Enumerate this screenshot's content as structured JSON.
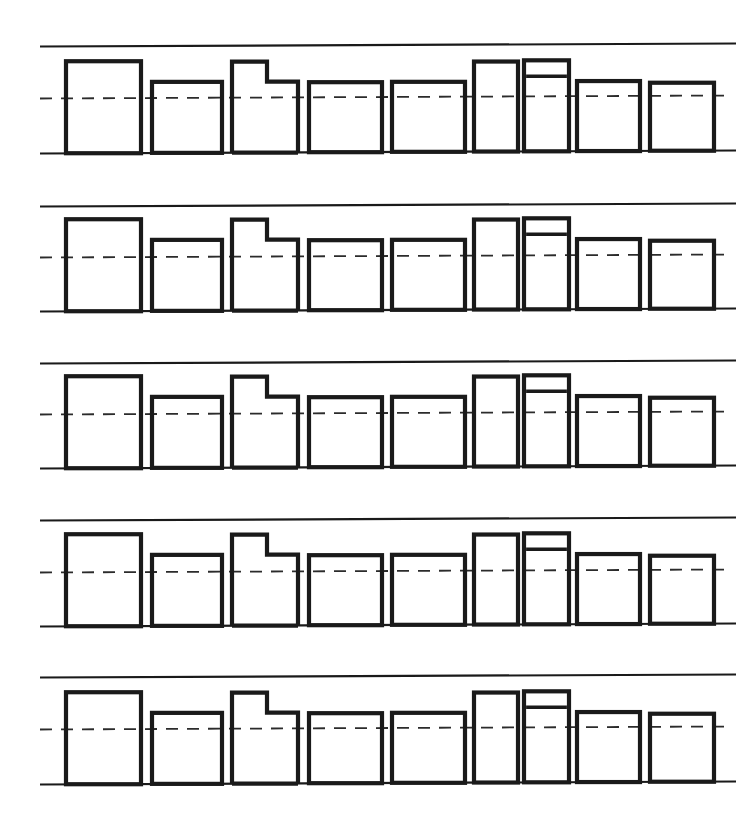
{
  "figure": {
    "background_color": "#ffffff",
    "stroke_color": "#1a1a1a",
    "dashed_line_color": "#2b2b2b",
    "rule_line_color": "#1a1a1a",
    "canvas": {
      "width": 741,
      "height": 834
    },
    "row_count": 5,
    "shapes_per_row": 9,
    "line_weights": {
      "rule_line": 2.2,
      "block_outline": 4.2,
      "block_inner_divider": 3.4,
      "dashed_center": 1.8
    },
    "dash_pattern": "12 9"
  },
  "rows": [
    {
      "name": "row-1",
      "top_rule_y": 45,
      "baseline_y": 152,
      "dash_y": 97,
      "rule_x_start": 40,
      "rule_x_end": 736,
      "dash_x_start": 40,
      "dash_x_end": 730
    },
    {
      "name": "row-2",
      "top_rule_y": 205,
      "baseline_y": 310,
      "dash_y": 256,
      "rule_x_start": 40,
      "rule_x_end": 736,
      "dash_x_start": 40,
      "dash_x_end": 730
    },
    {
      "name": "row-3",
      "top_rule_y": 362,
      "baseline_y": 467,
      "dash_y": 413,
      "rule_x_start": 40,
      "rule_x_end": 736,
      "dash_x_start": 40,
      "dash_x_end": 730
    },
    {
      "name": "row-4",
      "top_rule_y": 519,
      "baseline_y": 625,
      "dash_y": 571,
      "rule_x_start": 40,
      "rule_x_end": 736,
      "dash_x_start": 40,
      "dash_x_end": 730
    },
    {
      "name": "row-5",
      "top_rule_y": 676,
      "baseline_y": 783,
      "dash_y": 728,
      "rule_x_start": 40,
      "rule_x_end": 736,
      "dash_x_start": 40,
      "dash_x_end": 730
    }
  ],
  "blocks": [
    {
      "index": 1,
      "name": "block-1-tall-plain",
      "type": "rect",
      "x": 66,
      "width": 75,
      "height": 92
    },
    {
      "index": 2,
      "name": "block-2-medium-plain",
      "type": "rect",
      "x": 152,
      "width": 70,
      "height": 71
    },
    {
      "index": 3,
      "name": "block-3-stepped-L",
      "type": "step",
      "x": 232,
      "width": 66,
      "height": 91,
      "step_x_offset": 35,
      "step_height": 71
    },
    {
      "index": 4,
      "name": "block-4-medium-plain",
      "type": "rect",
      "x": 309,
      "width": 73,
      "height": 70
    },
    {
      "index": 5,
      "name": "block-5-medium-plain",
      "type": "rect",
      "x": 392,
      "width": 73,
      "height": 70
    },
    {
      "index": 6,
      "name": "block-6-narrow-tall",
      "type": "rect",
      "x": 474,
      "width": 44,
      "height": 90
    },
    {
      "index": 7,
      "name": "block-7-narrow-tall-banded",
      "type": "rect-banded",
      "x": 524,
      "width": 45,
      "height": 91,
      "band_height": 16
    },
    {
      "index": 8,
      "name": "block-8-medium-plain",
      "type": "rect",
      "x": 577,
      "width": 63,
      "height": 70
    },
    {
      "index": 9,
      "name": "block-9-medium-plain",
      "type": "rect",
      "x": 650,
      "width": 64,
      "height": 68
    }
  ],
  "labels": {
    "figure_caption": "",
    "axis_label": "",
    "units": ""
  }
}
